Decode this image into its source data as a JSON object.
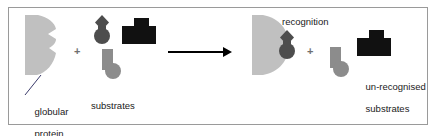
{
  "figure": {
    "border_color": "#9a9a9a",
    "background": "#ffffff"
  },
  "colors": {
    "protein_gray": "#c0c0c0",
    "substrate_dark_gray": "#4d4d4d",
    "substrate_black": "#111111",
    "substrate_mid_gray": "#8c8c8c",
    "arrow_black": "#000000",
    "text": "#1a1a1a",
    "plus_gray": "#6f6f6f"
  },
  "left_panel": {
    "protein_label_line1": "globular",
    "protein_label_line2": "protein",
    "substrates_label": "substrates",
    "plus_sign": "+",
    "substrates": [
      {
        "name": "diamond-knob-substrate",
        "fill": "#4d4d4d"
      },
      {
        "name": "block-dome-substrate",
        "fill": "#111111"
      },
      {
        "name": "ell-foot-substrate",
        "fill": "#8c8c8c"
      }
    ]
  },
  "arrow": {
    "name": "reaction-arrow",
    "direction": "right"
  },
  "right_panel": {
    "recognition_label": "recognition",
    "plus_sign": "+",
    "unrecognised_label_line1": "un-recognised",
    "unrecognised_label_line2": "substrates",
    "bound_substrate": {
      "name": "diamond-knob-substrate",
      "fill": "#4d4d4d"
    },
    "free_substrates": [
      {
        "name": "ell-foot-substrate",
        "fill": "#8c8c8c"
      },
      {
        "name": "block-dome-substrate",
        "fill": "#111111"
      }
    ]
  }
}
